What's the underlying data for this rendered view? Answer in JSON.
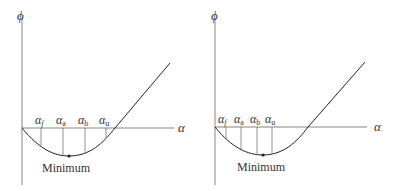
{
  "panels": [
    {
      "y_label": "ϕ",
      "x_label": "α",
      "minimum_label": "Minimum",
      "markers": [
        {
          "sym": "α",
          "sub": "f"
        },
        {
          "sym": "α",
          "sub": "a"
        },
        {
          "sym": "α",
          "sub": "b"
        },
        {
          "sym": "α",
          "sub": "u"
        }
      ]
    },
    {
      "y_label": "ϕ",
      "x_label": "α",
      "minimum_label": "Minimum",
      "markers": [
        {
          "sym": "α",
          "sub": "f"
        },
        {
          "sym": "α",
          "sub": "a"
        },
        {
          "sym": "α",
          "sub": "b"
        },
        {
          "sym": "α",
          "sub": "u"
        }
      ]
    }
  ]
}
